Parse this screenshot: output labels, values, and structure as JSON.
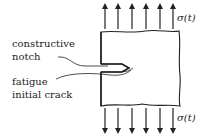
{
  "diagram": {
    "title": "",
    "labels": {
      "constructive_notch_line1": "constructive",
      "constructive_notch_line2": "notch",
      "fatigue_crack_line1": "fatigue",
      "fatigue_crack_line2": "initial crack",
      "stress_top": "σ(t)",
      "stress_bottom": "σ(t)"
    },
    "arrows": {
      "top_count": 6,
      "bottom_count": 6,
      "direction_top": "up",
      "direction_bottom": "down"
    },
    "colors": {
      "stroke": "#222222",
      "background": "#ffffff"
    }
  }
}
